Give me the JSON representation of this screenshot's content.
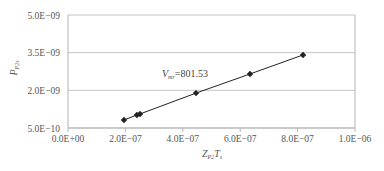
{
  "chart_data": {
    "type": "scatter",
    "title": "",
    "xlabel": "Z_P2 T_s",
    "xlabel_main": "Z",
    "xlabel_sub1": "P2",
    "xlabel_main2": "T",
    "xlabel_sub2": "s",
    "ylabel": "P_P2s",
    "ylabel_main": "P",
    "ylabel_sub": "P2s",
    "xlim": [
      0,
      1e-06
    ],
    "ylim": [
      5e-10,
      5e-09
    ],
    "x_ticks": [
      0,
      2e-07,
      4e-07,
      6e-07,
      8e-07,
      1e-06
    ],
    "x_tick_labels": [
      "0.0E+00",
      "2.0E−07",
      "4.0E−07",
      "6.0E−07",
      "8.0E−07",
      "1.0E−06"
    ],
    "y_ticks": [
      5e-10,
      2e-09,
      3.5e-09,
      5e-09
    ],
    "y_tick_labels": [
      "5.0E−10",
      "2.0E−09",
      "3.5E−09",
      "5.0E−09"
    ],
    "grid": {
      "horizontal": true,
      "vertical": false
    },
    "legend": null,
    "annotation": {
      "label_main": "V",
      "label_sub": "mr",
      "value_text": "=801.53",
      "x": 3.2e-07,
      "y": 2.65e-09
    },
    "series": [
      {
        "name": "data",
        "marker": "diamond",
        "line": true,
        "color": "#222222",
        "x": [
          1.95e-07,
          2.4e-07,
          2.51e-07,
          4.46e-07,
          6.34e-07,
          8.19e-07
        ],
        "y": [
          8.2e-10,
          1.02e-09,
          1.06e-09,
          1.89e-09,
          2.65e-09,
          3.41e-09
        ]
      }
    ]
  },
  "colors": {
    "axis": "#b5b5b5",
    "grid": "#c4c4c4",
    "series": "#222222",
    "text": "#555555"
  }
}
